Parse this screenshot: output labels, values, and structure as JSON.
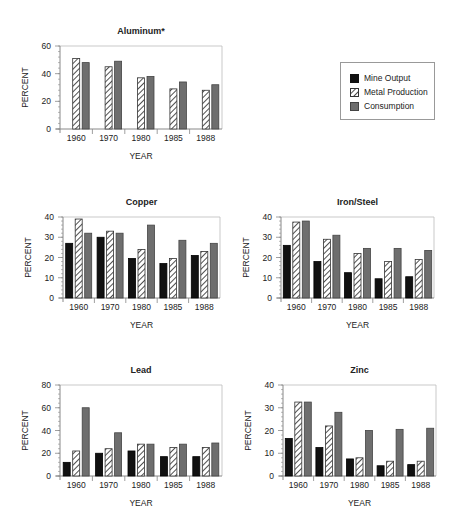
{
  "legend": {
    "items": [
      {
        "label": "Mine Output",
        "style": "solid-black",
        "color": "#111111"
      },
      {
        "label": "Metal Production",
        "style": "hatched",
        "color": "#333333"
      },
      {
        "label": "Consumption",
        "style": "solid-gray",
        "color": "#6e6e6e"
      }
    ]
  },
  "colors": {
    "mine": "#111111",
    "metal_stroke": "#333333",
    "consumption": "#6e6e6e",
    "axis": "#888888",
    "text": "#222222"
  },
  "chart_data": [
    {
      "type": "bar",
      "title": "Aluminum*",
      "xlabel": "YEAR",
      "ylabel": "PERCENT",
      "categories": [
        "1960",
        "1970",
        "1980",
        "1985",
        "1988"
      ],
      "ylim": [
        0,
        60
      ],
      "yticks": [
        0,
        20,
        40,
        60
      ],
      "series": [
        {
          "name": "Metal Production",
          "values": [
            51,
            45,
            37,
            29,
            28
          ]
        },
        {
          "name": "Consumption",
          "values": [
            48,
            49,
            38,
            34,
            32
          ]
        }
      ],
      "grid": false,
      "legend_position": "right (shared)"
    },
    {
      "type": "bar",
      "title": "Copper",
      "xlabel": "YEAR",
      "ylabel": "PERCENT",
      "categories": [
        "1960",
        "1970",
        "1980",
        "1985",
        "1988"
      ],
      "ylim": [
        0,
        40
      ],
      "yticks": [
        0,
        10,
        20,
        30,
        40
      ],
      "series": [
        {
          "name": "Mine Output",
          "values": [
            27,
            30,
            19.5,
            17,
            21
          ]
        },
        {
          "name": "Metal Production",
          "values": [
            39,
            33,
            24,
            19.5,
            23
          ]
        },
        {
          "name": "Consumption",
          "values": [
            32,
            32,
            36,
            28.5,
            27
          ]
        }
      ],
      "grid": false
    },
    {
      "type": "bar",
      "title": "Iron/Steel",
      "xlabel": "YEAR",
      "ylabel": "PERCENT",
      "categories": [
        "1960",
        "1970",
        "1980",
        "1985",
        "1988"
      ],
      "ylim": [
        0,
        40
      ],
      "yticks": [
        0,
        10,
        20,
        30,
        40
      ],
      "series": [
        {
          "name": "Mine Output",
          "values": [
            26,
            18,
            12.5,
            9.5,
            10.5
          ]
        },
        {
          "name": "Metal Production",
          "values": [
            37.5,
            29,
            22,
            18,
            19
          ]
        },
        {
          "name": "Consumption",
          "values": [
            38,
            31,
            24.5,
            24.5,
            23.5
          ]
        }
      ],
      "grid": false
    },
    {
      "type": "bar",
      "title": "Lead",
      "xlabel": "YEAR",
      "ylabel": "PERCENT",
      "categories": [
        "1960",
        "1970",
        "1980",
        "1985",
        "1988"
      ],
      "ylim": [
        0,
        80
      ],
      "yticks": [
        0,
        20,
        40,
        60,
        80
      ],
      "series": [
        {
          "name": "Mine Output",
          "values": [
            12,
            20,
            22,
            17,
            17
          ]
        },
        {
          "name": "Metal Production",
          "values": [
            22,
            24,
            28,
            25,
            25
          ]
        },
        {
          "name": "Consumption",
          "values": [
            60,
            38,
            28,
            28,
            29
          ]
        }
      ],
      "grid": false
    },
    {
      "type": "bar",
      "title": "Zinc",
      "xlabel": "YEAR",
      "ylabel": "PERCENT",
      "categories": [
        "1960",
        "1970",
        "1980",
        "1985",
        "1988"
      ],
      "ylim": [
        0,
        40
      ],
      "yticks": [
        0,
        10,
        20,
        30,
        40
      ],
      "series": [
        {
          "name": "Mine Output",
          "values": [
            16.5,
            12.5,
            7.5,
            4.5,
            5
          ]
        },
        {
          "name": "Metal Production",
          "values": [
            32.5,
            22,
            8,
            6.5,
            6.5
          ]
        },
        {
          "name": "Consumption",
          "values": [
            32.5,
            28,
            20,
            20.5,
            21
          ]
        }
      ],
      "grid": false
    }
  ]
}
